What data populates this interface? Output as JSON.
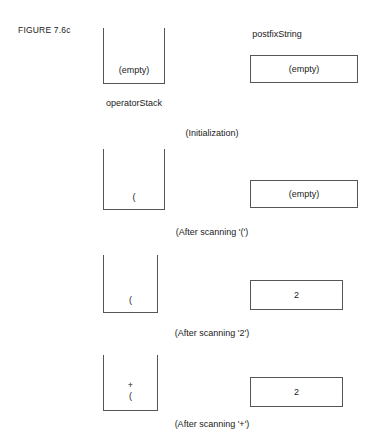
{
  "figure": {
    "label": "FIGURE 7.6c"
  },
  "headers": {
    "postfix_string": "postfixString",
    "operator_stack": "operatorStack"
  },
  "steps": [
    {
      "caption": "(Initialization)",
      "stack_label": "operatorStack",
      "stack_contents": "(empty)",
      "stack_items": [],
      "box_label": "postfixString",
      "box_value": "(empty)"
    },
    {
      "caption": "(After scanning '(')",
      "stack_contents": "",
      "stack_items": [
        "("
      ],
      "box_value": "(empty)"
    },
    {
      "caption": "(After scanning '2')",
      "stack_contents": "",
      "stack_items": [
        "("
      ],
      "box_value": "2"
    },
    {
      "caption": "(After scanning '+')",
      "stack_contents": "",
      "stack_items": [
        "+",
        "("
      ],
      "box_value": "2"
    }
  ],
  "colors": {
    "outline": "#555555",
    "text": "#1a1a1a",
    "background": "#ffffff"
  }
}
